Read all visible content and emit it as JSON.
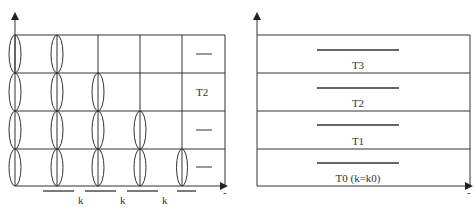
{
  "left_diagram": {
    "row_labels": [
      "—",
      "T2",
      "—",
      "—"
    ],
    "x_axis_labels": [
      "k",
      "k",
      "k"
    ],
    "x_axis_end_mark": "-",
    "columns": 5,
    "rows": 4,
    "ellipse_counts_per_column": [
      4,
      4,
      3,
      2,
      1
    ]
  },
  "right_diagram": {
    "bands": [
      {
        "label": "T3"
      },
      {
        "label": "T2"
      },
      {
        "label": "T1"
      },
      {
        "label": "T0 (k=k0)"
      }
    ],
    "x_axis_end_mark": "-"
  },
  "colors": {
    "line": "#333333",
    "background": "#ffffff"
  }
}
